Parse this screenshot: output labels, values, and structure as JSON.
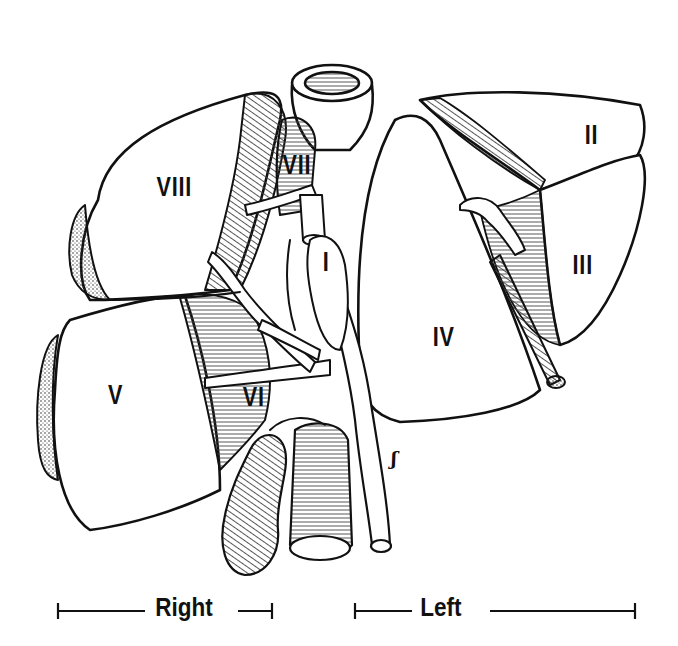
{
  "figure": {
    "segments": [
      {
        "id": "I",
        "label": "I"
      },
      {
        "id": "II",
        "label": "II"
      },
      {
        "id": "III",
        "label": "III"
      },
      {
        "id": "IV",
        "label": "IV"
      },
      {
        "id": "V",
        "label": "V"
      },
      {
        "id": "VI",
        "label": "VI"
      },
      {
        "id": "VII",
        "label": "VII"
      },
      {
        "id": "VIII",
        "label": "VIII"
      }
    ],
    "scale_bars": {
      "right": {
        "label": "Right"
      },
      "left": {
        "label": "Left"
      }
    },
    "signature": "ʃ"
  },
  "colors": {
    "ink": "#111111",
    "background": "#ffffff",
    "hatch": "#555555"
  }
}
